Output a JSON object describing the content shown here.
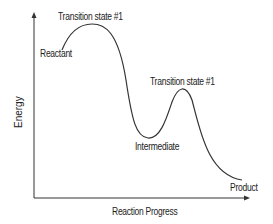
{
  "diagram": {
    "type": "energy-profile",
    "axes": {
      "y_label": "Energy",
      "x_label": "Reaction Progress"
    },
    "labels": {
      "reactant": "Reactant",
      "transition_state_1": "Transition state #1",
      "transition_state_2": "Transition state #1",
      "intermediate": "Intermediate",
      "product": "Product"
    },
    "colors": {
      "line": "#333333",
      "text": "#222222"
    }
  }
}
